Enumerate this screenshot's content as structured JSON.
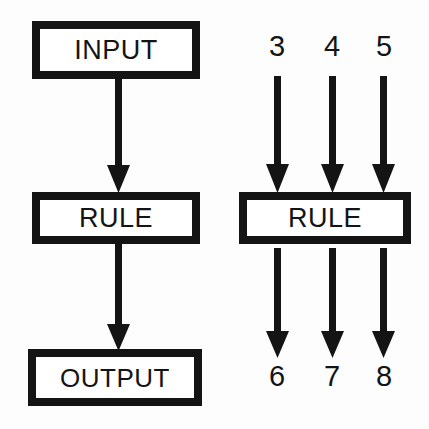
{
  "diagram": {
    "ink_color": "#141414",
    "background_color": "#fdfdfd",
    "left_column": {
      "name": "abstract-pipeline",
      "nodes": [
        {
          "id": "input",
          "label": "INPUT"
        },
        {
          "id": "rule",
          "label": "RULE"
        },
        {
          "id": "output",
          "label": "OUTPUT"
        }
      ],
      "connectors": [
        {
          "id": "input-to-rule",
          "from": "input",
          "to": "rule",
          "shape": "down-arrow"
        },
        {
          "id": "rule-to-output",
          "from": "rule",
          "to": "output",
          "shape": "down-arrow"
        }
      ]
    },
    "right_column": {
      "name": "worked-example",
      "rule_label": "RULE",
      "inputs": [
        "3",
        "4",
        "5"
      ],
      "outputs": [
        "6",
        "7",
        "8"
      ],
      "input_connectors": [
        {
          "id": "in-arrow-3",
          "label": "3",
          "shape": "down-arrow"
        },
        {
          "id": "in-arrow-4",
          "label": "4",
          "shape": "down-arrow"
        },
        {
          "id": "in-arrow-5",
          "label": "5",
          "shape": "down-arrow"
        }
      ],
      "output_connectors": [
        {
          "id": "out-arrow-6",
          "label": "6",
          "shape": "down-arrow"
        },
        {
          "id": "out-arrow-7",
          "label": "7",
          "shape": "down-arrow"
        },
        {
          "id": "out-arrow-8",
          "label": "8",
          "shape": "down-arrow"
        }
      ]
    }
  }
}
